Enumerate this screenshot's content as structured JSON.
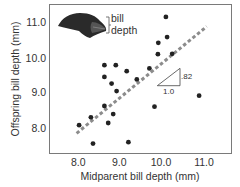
{
  "chart_data": {
    "type": "scatter",
    "title": "",
    "xlabel": "Midparent bill depth (mm)",
    "ylabel": "Offspring bill depth (mm)",
    "xlim": [
      7.5,
      11.6
    ],
    "ylim": [
      7.3,
      11.5
    ],
    "xticks": [
      "8.0",
      "9.0",
      "10.0",
      "11.0"
    ],
    "yticks": [
      "8.0",
      "9.0",
      "10.0",
      "11.0"
    ],
    "grid": false,
    "legend": null,
    "series": [
      {
        "name": "finches",
        "points": [
          {
            "x": 8.02,
            "y": 8.1
          },
          {
            "x": 8.3,
            "y": 8.32
          },
          {
            "x": 8.35,
            "y": 7.58
          },
          {
            "x": 8.62,
            "y": 8.64
          },
          {
            "x": 8.71,
            "y": 8.16
          },
          {
            "x": 8.83,
            "y": 8.41
          },
          {
            "x": 8.62,
            "y": 9.79
          },
          {
            "x": 8.89,
            "y": 9.79
          },
          {
            "x": 8.62,
            "y": 9.46
          },
          {
            "x": 8.79,
            "y": 9.27
          },
          {
            "x": 8.91,
            "y": 9.06
          },
          {
            "x": 9.15,
            "y": 9.62
          },
          {
            "x": 9.19,
            "y": 7.62
          },
          {
            "x": 9.39,
            "y": 9.39
          },
          {
            "x": 9.69,
            "y": 9.7
          },
          {
            "x": 9.81,
            "y": 8.62
          },
          {
            "x": 9.89,
            "y": 10.1
          },
          {
            "x": 10.23,
            "y": 10.11
          },
          {
            "x": 9.9,
            "y": 10.42
          },
          {
            "x": 10.11,
            "y": 10.58
          },
          {
            "x": 10.08,
            "y": 11.15
          },
          {
            "x": 10.87,
            "y": 8.93
          }
        ]
      }
    ],
    "regression_line": {
      "style": "dashed",
      "x0": 7.96,
      "y0": 7.87,
      "x1": 11.05,
      "y1": 10.88
    },
    "slope_annotation": {
      "rise": ".82",
      "run": "1.0"
    },
    "inset_annotation": {
      "line1": "bill",
      "line2": "depth"
    }
  },
  "colors": {
    "points": "#222222",
    "regression": "#8c8c8c",
    "axis": "#7a7a7a",
    "text": "#333333"
  }
}
